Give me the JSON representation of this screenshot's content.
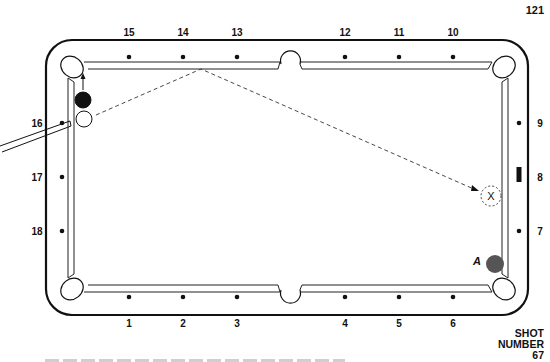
{
  "page": {
    "number": "121"
  },
  "shot": {
    "label_line1": "SHOT",
    "label_line2": "NUMBER",
    "number": "67"
  },
  "table": {
    "diamonds": {
      "top": [
        {
          "label": "15",
          "x": 129
        },
        {
          "label": "14",
          "x": 183
        },
        {
          "label": "13",
          "x": 237
        },
        {
          "label": "12",
          "x": 345
        },
        {
          "label": "11",
          "x": 399
        },
        {
          "label": "10",
          "x": 453
        }
      ],
      "bottom": [
        {
          "label": "1",
          "x": 129
        },
        {
          "label": "2",
          "x": 183
        },
        {
          "label": "3",
          "x": 237
        },
        {
          "label": "4",
          "x": 345
        },
        {
          "label": "5",
          "x": 399
        },
        {
          "label": "6",
          "x": 453
        }
      ],
      "left": [
        {
          "label": "16",
          "y": 123
        },
        {
          "label": "17",
          "y": 177
        },
        {
          "label": "18",
          "y": 231
        }
      ],
      "right": [
        {
          "label": "9",
          "y": 123
        },
        {
          "label": "8",
          "y": 177
        },
        {
          "label": "7",
          "y": 231
        }
      ]
    },
    "balls": {
      "object_ball": {
        "color": "#111111"
      },
      "cue_ball": {
        "color": "#ffffff"
      },
      "ball_a": {
        "label": "A",
        "color": "#555555"
      },
      "ghost_ball": {
        "label": "X"
      }
    }
  }
}
